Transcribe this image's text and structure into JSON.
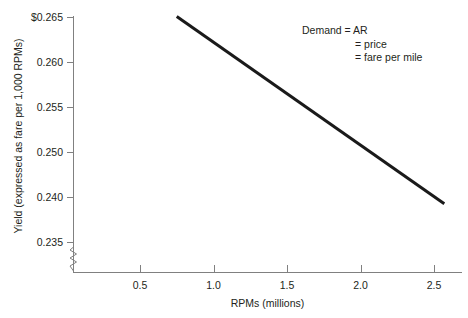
{
  "chart_data": {
    "type": "line",
    "title": "",
    "xlabel": "RPMs (millions)",
    "ylabel": "Yield (expressed as fare per 1,000 RPMs)",
    "xlim": [
      0,
      2.66
    ],
    "ylim": [
      0.2325,
      0.265
    ],
    "grid": false,
    "legend": "none",
    "x_ticks": [
      {
        "value": 0.5,
        "label": "0.5"
      },
      {
        "value": 1.0,
        "label": "1.0"
      },
      {
        "value": 1.5,
        "label": "1.5"
      },
      {
        "value": 2.0,
        "label": "2.0"
      },
      {
        "value": 2.5,
        "label": "2.5"
      }
    ],
    "y_ticks": [
      {
        "value": 0.265,
        "label": "$0.265"
      },
      {
        "value": 0.26,
        "label": "0.260"
      },
      {
        "value": 0.255,
        "label": "0.255"
      },
      {
        "value": 0.25,
        "label": "0.250"
      },
      {
        "value": 0.24,
        "label": "0.240"
      },
      {
        "value": 0.235,
        "label": "0.235"
      }
    ],
    "y_axis_break": true,
    "series": [
      {
        "name": "Demand",
        "color": "#1a1a1a",
        "line_width": 3,
        "x": [
          0.75,
          2.57
        ],
        "values": [
          0.265,
          0.2392
        ],
        "points": [
          {
            "x": 0.75,
            "y": 0.265
          },
          {
            "x": 2.57,
            "y": 0.2392
          }
        ]
      }
    ],
    "annotations": [
      {
        "name": "demand-label",
        "lines": [
          {
            "label": "Demand",
            "value": "= AR"
          },
          {
            "label": "",
            "value": "= price"
          },
          {
            "label": "",
            "value": "= fare per mile"
          }
        ]
      }
    ]
  }
}
